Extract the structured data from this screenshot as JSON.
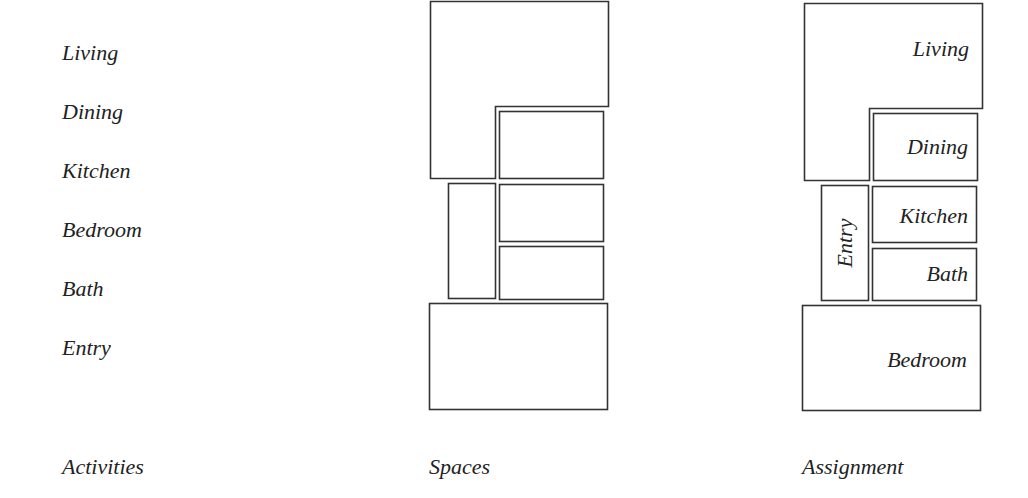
{
  "activities": {
    "caption": "Activities",
    "items": [
      "Living",
      "Dining",
      "Kitchen",
      "Bedroom",
      "Bath",
      "Entry"
    ]
  },
  "spaces": {
    "caption": "Spaces"
  },
  "assignment": {
    "caption": "Assignment",
    "rooms": {
      "living": "Living",
      "dining": "Dining",
      "kitchen": "Kitchen",
      "bath": "Bath",
      "entry": "Entry",
      "bedroom": "Bedroom"
    }
  },
  "colors": {
    "line": "#333333",
    "text": "#222222",
    "background": "#ffffff"
  }
}
